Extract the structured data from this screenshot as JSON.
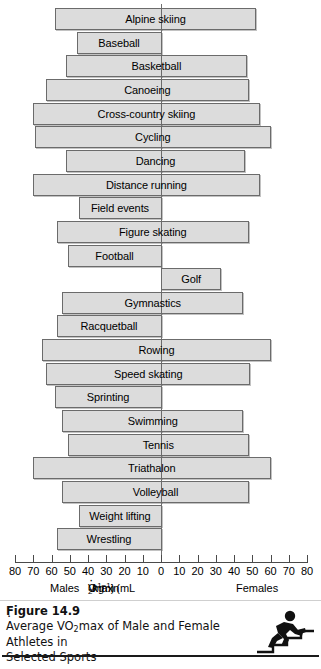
{
  "chart_data": {
    "type": "bar",
    "orientation": "horizontal-diverging",
    "figure_number": "Figure 14.9",
    "xlabel": "VO2 max (mL·kg−1·min−1)",
    "left_axis_name": "Males",
    "right_axis_name": "Females",
    "xlim": [
      -80,
      80
    ],
    "tick_values": [
      -80,
      -70,
      -60,
      -50,
      -40,
      -30,
      -20,
      -10,
      0,
      10,
      20,
      30,
      40,
      50,
      60,
      70,
      80
    ],
    "tick_labels": [
      "80",
      "70",
      "60",
      "50",
      "40",
      "30",
      "20",
      "10",
      "0",
      "10",
      "20",
      "30",
      "40",
      "50",
      "60",
      "70",
      "80"
    ],
    "grid": false,
    "legend": "none",
    "categories": [
      "Alpine skiing",
      "Baseball",
      "Basketball",
      "Canoeing",
      "Cross-country skiing",
      "Cycling",
      "Dancing",
      "Distance running",
      "Field events",
      "Figure skating",
      "Football",
      "Golf",
      "Gymnastics",
      "Racquetball",
      "Rowing",
      "Speed skating",
      "Sprinting",
      "Swimming",
      "Tennis",
      "Triathalon",
      "Volleyball",
      "Weight lifting",
      "Wrestling"
    ],
    "series": [
      {
        "name": "Males",
        "values": [
          58,
          46,
          52,
          63,
          70,
          69,
          52,
          70,
          45,
          57,
          51,
          0,
          54,
          57,
          65,
          63,
          58,
          54,
          51,
          70,
          54,
          45,
          57
        ]
      },
      {
        "name": "Females",
        "values": [
          52,
          0,
          47,
          48,
          54,
          60,
          46,
          54,
          0,
          48,
          0,
          33,
          45,
          0,
          60,
          49,
          0,
          45,
          48,
          60,
          48,
          0,
          0
        ]
      }
    ]
  },
  "axis": {
    "units_label_prefix": "VO",
    "units_label_sub": "2",
    "units_label_mid": " max (mL",
    "units_label_kg": "kg",
    "units_label_exp1": "−1",
    "units_label_min": "min",
    "units_label_exp2": "−1",
    "units_label_close": ")",
    "males": "Males",
    "females": "Females"
  },
  "caption": {
    "figure_number": "Figure 14.9",
    "line1_a": "Average V",
    "line1_sub": "O",
    "line1_sub2": "2",
    "line1_b": "max of Male and Female Athletes in",
    "line2": "Selected Sports",
    "full_text": "Average V̇O2max of Male and Female Athletes in Selected Sports"
  },
  "icons": {
    "runner": "runner-climbing-stairs-icon"
  },
  "colors": {
    "bar_fill": "#dcdcdc",
    "bar_border": "#6b6b6b",
    "axis": "#4a4a4a",
    "text": "#000000"
  }
}
